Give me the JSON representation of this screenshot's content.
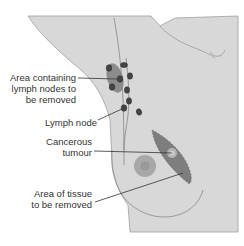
{
  "diagram": {
    "colors": {
      "body_fill": "#d8d8d8",
      "body_outline": "#9a9a9a",
      "node_fill": "#4a4a4a",
      "node_area_fill": "#8c8c8c",
      "tumour_area_fill": "#7e7e7e",
      "tumour_center": "#bcbcbc",
      "nipple_fill": "#a8a8a8",
      "leader_line": "#333333",
      "text": "#333333"
    },
    "labels": {
      "lymph_area": {
        "line1": "Area containing",
        "line2": "lymph nodes to",
        "line3": "be removed"
      },
      "lymph_node": {
        "line1": "Lymph node"
      },
      "tumour": {
        "line1": "Cancerous",
        "line2": "tumour"
      },
      "tissue_area": {
        "line1": "Area of tissue",
        "line2": "to be removed"
      }
    }
  }
}
